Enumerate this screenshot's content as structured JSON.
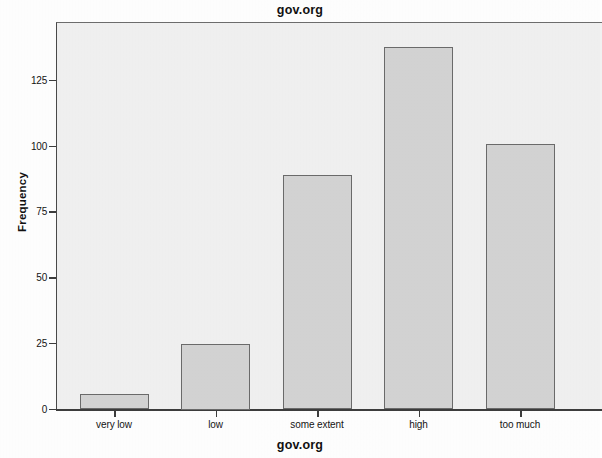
{
  "chart_data": {
    "type": "bar",
    "title": "gov.org",
    "xlabel": "gov.org",
    "ylabel": "Frequency",
    "categories": [
      "very low",
      "low",
      "some extent",
      "high",
      "too much"
    ],
    "values": [
      6,
      25,
      89,
      138,
      101
    ],
    "ylim": [
      0,
      140
    ],
    "ytick_labels": [
      "0",
      "25",
      "50",
      "75",
      "100",
      "125"
    ],
    "ytick_values": [
      0,
      25,
      50,
      75,
      100,
      125
    ],
    "grid": false,
    "legend": null,
    "colors": {
      "bar_fill": "#d4d4d4",
      "bar_border": "#6b6b6b",
      "plot_background": "#f1f1f1",
      "axis": "#3d3d3d",
      "text": "#141414",
      "page_background": "#ffffff"
    }
  }
}
